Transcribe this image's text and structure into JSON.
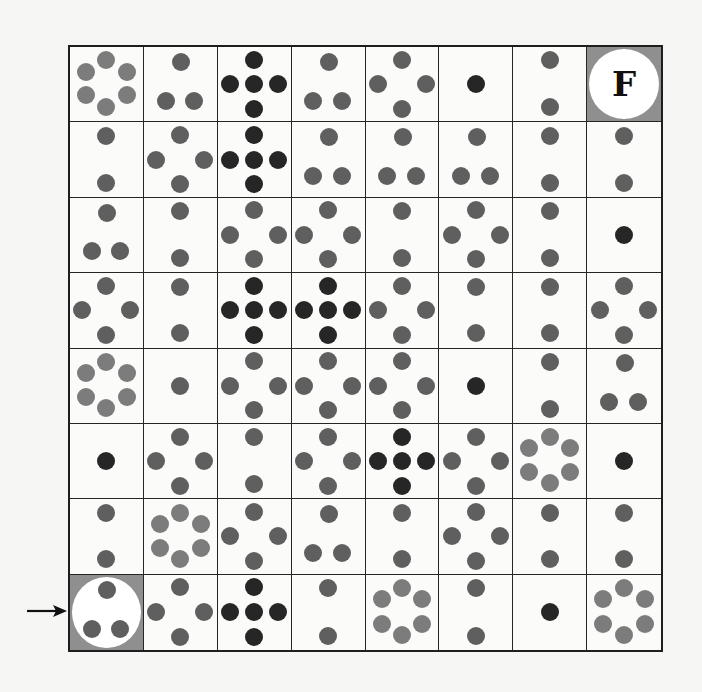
{
  "puzzle": {
    "rows": 8,
    "cols": 8,
    "start": {
      "row": 7,
      "col": 0,
      "label": ""
    },
    "finish": {
      "row": 0,
      "col": 7,
      "label": "F"
    },
    "start_arrow": "arrow-right-icon",
    "colors": {
      "dot_gray": "#5f5f5f",
      "dot_light": "#7c7c7c",
      "dot_dark": "#262626",
      "marked_cell_bg": "#8f8f8f",
      "grid_line": "#262626"
    },
    "patterns": {
      "1": {
        "shape": "single-center",
        "count": 1
      },
      "2": {
        "shape": "vertical-pair",
        "count": 2
      },
      "3": {
        "shape": "triangle",
        "count": 3
      },
      "4": {
        "shape": "diamond",
        "count": 4
      },
      "5": {
        "shape": "cross",
        "count": 5
      },
      "6": {
        "shape": "hexagon",
        "count": 6
      }
    },
    "grid": [
      [
        {
          "n": 6,
          "tone": "light"
        },
        {
          "n": 3,
          "tone": "gray"
        },
        {
          "n": 5,
          "tone": "dark"
        },
        {
          "n": 3,
          "tone": "gray"
        },
        {
          "n": 4,
          "tone": "gray"
        },
        {
          "n": 1,
          "tone": "dark"
        },
        {
          "n": 2,
          "tone": "gray"
        },
        {
          "n": 0,
          "tone": "finish"
        }
      ],
      [
        {
          "n": 2,
          "tone": "gray"
        },
        {
          "n": 4,
          "tone": "gray"
        },
        {
          "n": 5,
          "tone": "dark"
        },
        {
          "n": 3,
          "tone": "gray"
        },
        {
          "n": 3,
          "tone": "gray"
        },
        {
          "n": 3,
          "tone": "gray"
        },
        {
          "n": 2,
          "tone": "gray"
        },
        {
          "n": 2,
          "tone": "gray"
        }
      ],
      [
        {
          "n": 3,
          "tone": "gray"
        },
        {
          "n": 2,
          "tone": "gray"
        },
        {
          "n": 4,
          "tone": "gray"
        },
        {
          "n": 4,
          "tone": "gray"
        },
        {
          "n": 2,
          "tone": "gray"
        },
        {
          "n": 4,
          "tone": "gray"
        },
        {
          "n": 2,
          "tone": "gray"
        },
        {
          "n": 1,
          "tone": "dark"
        }
      ],
      [
        {
          "n": 4,
          "tone": "gray"
        },
        {
          "n": 2,
          "tone": "gray"
        },
        {
          "n": 5,
          "tone": "dark"
        },
        {
          "n": 5,
          "tone": "dark"
        },
        {
          "n": 4,
          "tone": "gray"
        },
        {
          "n": 2,
          "tone": "gray"
        },
        {
          "n": 2,
          "tone": "gray"
        },
        {
          "n": 4,
          "tone": "gray"
        }
      ],
      [
        {
          "n": 6,
          "tone": "light"
        },
        {
          "n": 1,
          "tone": "gray"
        },
        {
          "n": 4,
          "tone": "gray"
        },
        {
          "n": 4,
          "tone": "gray"
        },
        {
          "n": 4,
          "tone": "gray"
        },
        {
          "n": 1,
          "tone": "dark"
        },
        {
          "n": 2,
          "tone": "gray"
        },
        {
          "n": 3,
          "tone": "gray"
        }
      ],
      [
        {
          "n": 1,
          "tone": "dark"
        },
        {
          "n": 4,
          "tone": "gray"
        },
        {
          "n": 2,
          "tone": "gray"
        },
        {
          "n": 4,
          "tone": "gray"
        },
        {
          "n": 5,
          "tone": "dark"
        },
        {
          "n": 4,
          "tone": "gray"
        },
        {
          "n": 6,
          "tone": "light"
        },
        {
          "n": 1,
          "tone": "dark"
        }
      ],
      [
        {
          "n": 2,
          "tone": "gray"
        },
        {
          "n": 6,
          "tone": "light"
        },
        {
          "n": 4,
          "tone": "gray"
        },
        {
          "n": 3,
          "tone": "gray"
        },
        {
          "n": 2,
          "tone": "gray"
        },
        {
          "n": 4,
          "tone": "gray"
        },
        {
          "n": 2,
          "tone": "gray"
        },
        {
          "n": 2,
          "tone": "gray"
        }
      ],
      [
        {
          "n": 3,
          "tone": "start"
        },
        {
          "n": 4,
          "tone": "gray"
        },
        {
          "n": 5,
          "tone": "dark"
        },
        {
          "n": 2,
          "tone": "gray"
        },
        {
          "n": 6,
          "tone": "light"
        },
        {
          "n": 2,
          "tone": "gray"
        },
        {
          "n": 1,
          "tone": "dark"
        },
        {
          "n": 6,
          "tone": "light"
        }
      ]
    ]
  }
}
